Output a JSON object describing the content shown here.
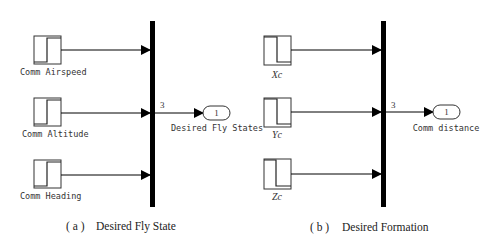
{
  "panels": [
    {
      "id": "a",
      "caption_prefix": "( a )",
      "caption": "Desired Fly State",
      "inputs": [
        {
          "label": "Comm Airspeed",
          "style": "mono"
        },
        {
          "label": "Comm Altitude",
          "style": "mono"
        },
        {
          "label": "Comm Heading",
          "style": "mono"
        }
      ],
      "mux_width": "3",
      "outport": {
        "number": "1",
        "label": "Desired Fly States"
      }
    },
    {
      "id": "b",
      "caption_prefix": "( b )",
      "caption": "Desired Formation",
      "inputs": [
        {
          "label": "Xc",
          "style": "italic"
        },
        {
          "label": "Yc",
          "style": "italic"
        },
        {
          "label": "Zc",
          "style": "italic"
        }
      ],
      "mux_width": "3",
      "outport": {
        "number": "1",
        "label": "Comm distance"
      }
    }
  ]
}
